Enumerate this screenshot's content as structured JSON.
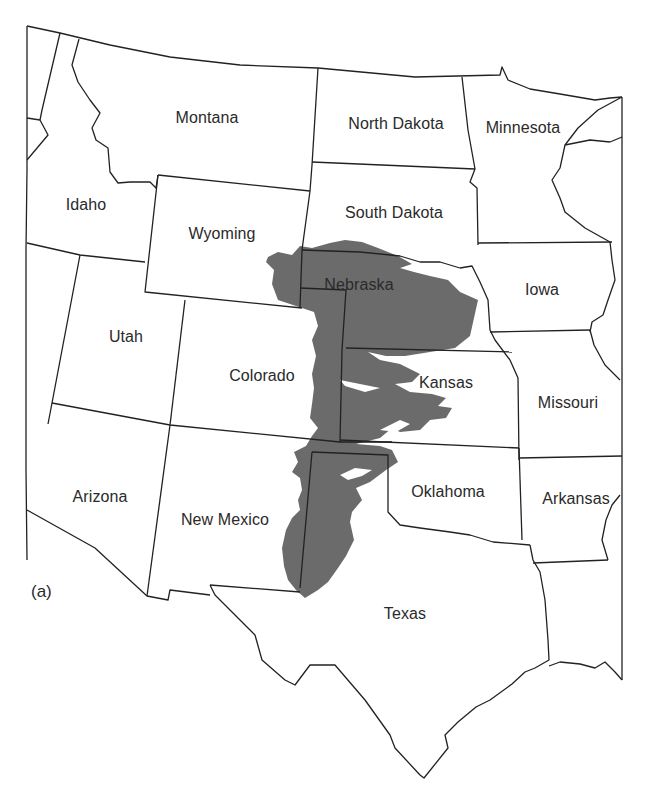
{
  "map": {
    "panel_label": "(a)",
    "highlight_color": "#6b6b6b",
    "border_color": "#222222",
    "highlighted_region": "shaded aquifer area spanning Nebraska, Kansas, Colorado, Oklahoma, New Mexico and Texas",
    "states": [
      {
        "name": "Montana",
        "x": 207,
        "y": 118
      },
      {
        "name": "North Dakota",
        "x": 396,
        "y": 124
      },
      {
        "name": "Minnesota",
        "x": 523,
        "y": 128
      },
      {
        "name": "Idaho",
        "x": 86,
        "y": 205
      },
      {
        "name": "Wyoming",
        "x": 222,
        "y": 234
      },
      {
        "name": "South Dakota",
        "x": 394,
        "y": 213
      },
      {
        "name": "Nebraska",
        "x": 359,
        "y": 285
      },
      {
        "name": "Iowa",
        "x": 542,
        "y": 290
      },
      {
        "name": "Utah",
        "x": 126,
        "y": 337
      },
      {
        "name": "Colorado",
        "x": 262,
        "y": 376
      },
      {
        "name": "Kansas",
        "x": 446,
        "y": 383
      },
      {
        "name": "Missouri",
        "x": 568,
        "y": 403
      },
      {
        "name": "Arizona",
        "x": 100,
        "y": 497
      },
      {
        "name": "New Mexico",
        "x": 225,
        "y": 520
      },
      {
        "name": "Oklahoma",
        "x": 448,
        "y": 492
      },
      {
        "name": "Arkansas",
        "x": 576,
        "y": 499
      },
      {
        "name": "Texas",
        "x": 405,
        "y": 614
      }
    ]
  }
}
